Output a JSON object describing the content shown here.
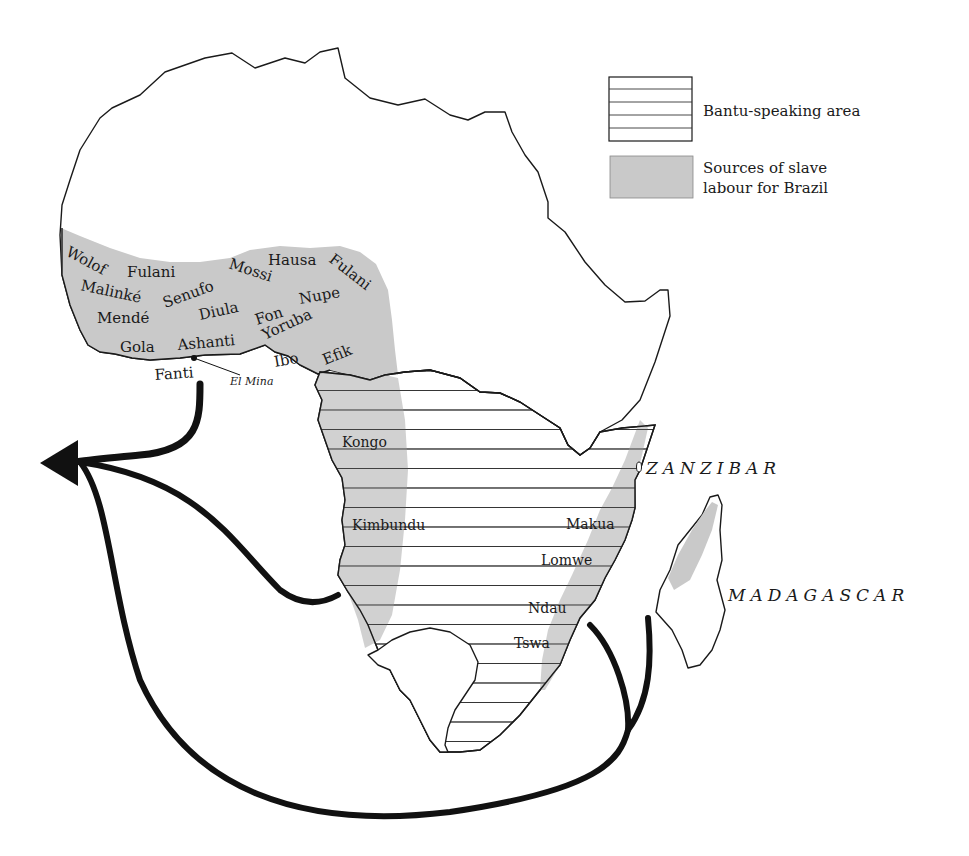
{
  "legend": {
    "items": [
      {
        "id": "bantu",
        "label": "Bantu-speaking area",
        "pattern": "horizontal-hatch"
      },
      {
        "id": "slave",
        "label_line1": "Sources of slave",
        "label_line2": "labour for Brazil",
        "color": "#c9c9c9"
      }
    ]
  },
  "peoples": {
    "west_africa": [
      "Wolof",
      "Fulani",
      "Malinké",
      "Senufo",
      "Mossi",
      "Hausa",
      "Fulani",
      "Mendé",
      "Diula",
      "Fon",
      "Nupe",
      "Gola",
      "Ashanti",
      "Yoruba",
      "Ibo",
      "Efik",
      "Fanti"
    ],
    "central_africa": [
      "Kongo",
      "Kimbundu"
    ],
    "east_africa": [
      "Makua",
      "Lomwe",
      "Ndau",
      "Tswa"
    ]
  },
  "places": {
    "el_mina": "El Mina",
    "zanzibar": "ZANZIBAR",
    "madagascar": "MADAGASCAR"
  },
  "colors": {
    "shade": "#c9c9c9",
    "outline": "#1a1a1a",
    "route": "#111111"
  }
}
